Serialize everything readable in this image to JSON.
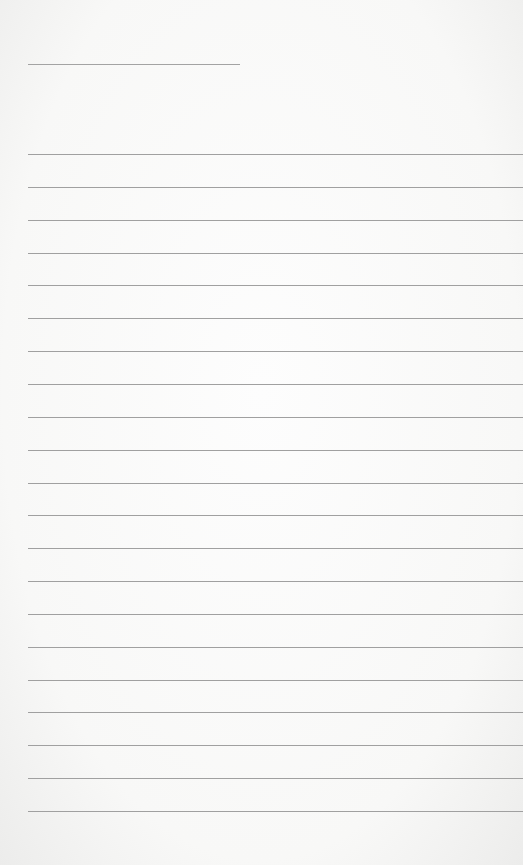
{
  "page": {
    "type": "lined-paper",
    "title_line_text": "",
    "ruled_line_count": 21,
    "lines": [
      "",
      "",
      "",
      "",
      "",
      "",
      "",
      "",
      "",
      "",
      "",
      "",
      "",
      "",
      "",
      "",
      "",
      "",
      "",
      "",
      ""
    ],
    "colors": {
      "paper": "#fbfbfa",
      "rule": "#a0a0a0"
    }
  }
}
